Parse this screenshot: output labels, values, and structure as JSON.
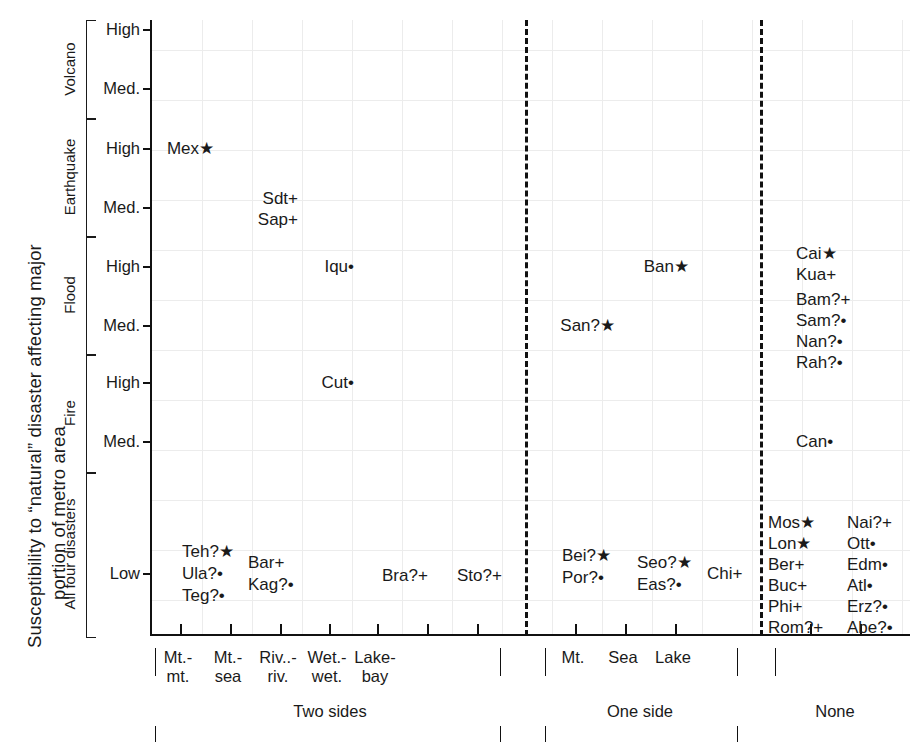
{
  "axis_title": {
    "line1": "Susceptibility to “natural” disaster affecting major",
    "line2": "portion of metro area"
  },
  "categories": [
    {
      "name": "Volcano",
      "label_top": 20,
      "label_bottom": 118,
      "levels": [
        "High",
        "Med."
      ]
    },
    {
      "name": "Earthquake",
      "label_top": 118,
      "label_bottom": 236,
      "levels": [
        "High",
        "Med."
      ]
    },
    {
      "name": "Flood",
      "label_top": 236,
      "label_bottom": 354,
      "levels": [
        "High",
        "Med."
      ]
    },
    {
      "name": "Fire",
      "label_top": 354,
      "label_bottom": 472,
      "levels": [
        "High",
        "Med."
      ]
    },
    {
      "name": "All four disasters",
      "label_top": 472,
      "label_bottom": 636,
      "levels": [
        "Low"
      ]
    }
  ],
  "y_ticks": [
    {
      "label": "High",
      "y": 29
    },
    {
      "label": "Med.",
      "y": 88
    },
    {
      "label": "High",
      "y": 148
    },
    {
      "label": "Med.",
      "y": 207
    },
    {
      "label": "High",
      "y": 266
    },
    {
      "label": "Med.",
      "y": 325
    },
    {
      "label": "High",
      "y": 382
    },
    {
      "label": "Med.",
      "y": 441
    },
    {
      "label": "Low",
      "y": 573
    }
  ],
  "x_ticks": [
    178,
    228,
    278,
    327,
    375,
    425,
    475,
    573,
    623,
    673,
    808,
    858
  ],
  "x_labels": [
    {
      "text": "Mt.-\nmt.",
      "x": 178
    },
    {
      "text": "Mt.-\nsea",
      "x": 228
    },
    {
      "text": "Riv..-\nriv.",
      "x": 278
    },
    {
      "text": "Wet.-\nwet.",
      "x": 327
    },
    {
      "text": "Lake-\nbay",
      "x": 375
    },
    {
      "text": "Mt.",
      "x": 573
    },
    {
      "text": "Sea",
      "x": 623
    },
    {
      "text": "Lake",
      "x": 673
    }
  ],
  "x_groups": [
    {
      "label": "Two sides",
      "x": 330
    },
    {
      "label": "One side",
      "x": 640
    },
    {
      "label": "None",
      "x": 835
    }
  ],
  "dividers": [
    523,
    758
  ],
  "chart_data": {
    "type": "scatter",
    "title": "Susceptibility to “natural” disaster affecting major portion of metro area",
    "xlabel": "",
    "ylabel": "Susceptibility to “natural” disaster affecting major portion of metro area",
    "grid": true,
    "legend": "none",
    "marker_meanings": {
      "star": "★-class",
      "plus": "+-class",
      "dot": "•-class"
    },
    "xlim": [
      "Mt.-mt.",
      "None"
    ],
    "ylim": [
      "Low",
      "Volcano High"
    ],
    "x_tick_labels": [
      "Mt.-mt.",
      "Mt.-sea",
      "Riv..-riv.",
      "Wet.-wet.",
      "Lake-bay",
      "Mt.",
      "Sea",
      "Lake"
    ],
    "y_tick_labels": [
      "High",
      "Med.",
      "High",
      "Med.",
      "High",
      "Med.",
      "High",
      "Med.",
      "Low"
    ],
    "y_category_labels": [
      "Volcano",
      "Earthquake",
      "Flood",
      "Fire",
      "All four disasters"
    ],
    "x_group_labels": [
      "Two sides",
      "One side",
      "None"
    ],
    "points": [
      {
        "name": "Mex",
        "marker": "★",
        "uncertain": false,
        "x_cat": "Mt.-mt.",
        "y_cat": "Earthquake High",
        "px": 212,
        "py": 148,
        "align": "right"
      },
      {
        "name": "Sdt",
        "marker": "+",
        "uncertain": false,
        "x_cat": "Mt.-sea",
        "y_cat": "Earthquake Med.",
        "px": 296,
        "py": 198,
        "align": "right"
      },
      {
        "name": "Sap",
        "marker": "+",
        "uncertain": false,
        "x_cat": "Mt.-sea",
        "y_cat": "Earthquake Med.",
        "px": 296,
        "py": 219,
        "align": "right"
      },
      {
        "name": "Iqu",
        "marker": "•",
        "uncertain": false,
        "x_cat": "Riv..-riv.",
        "y_cat": "Flood High",
        "px": 352,
        "py": 266,
        "align": "right"
      },
      {
        "name": "Cut",
        "marker": "•",
        "uncertain": false,
        "x_cat": "Riv..-riv.",
        "y_cat": "Fire High",
        "px": 352,
        "py": 382,
        "align": "right"
      },
      {
        "name": "Ban",
        "marker": "★",
        "uncertain": false,
        "x_cat": "Sea",
        "y_cat": "Flood High",
        "px": 687,
        "py": 266,
        "align": "right"
      },
      {
        "name": "San",
        "marker": "★",
        "uncertain": true,
        "x_cat": "Mt.",
        "y_cat": "Flood Med.",
        "px": 613,
        "py": 325,
        "align": "right"
      },
      {
        "name": "Cai",
        "marker": "★",
        "uncertain": false,
        "x_cat": "None",
        "y_cat": "Flood High",
        "px": 794,
        "py": 253,
        "align": "left"
      },
      {
        "name": "Kua",
        "marker": "+",
        "uncertain": false,
        "x_cat": "None",
        "y_cat": "Flood High",
        "px": 794,
        "py": 274,
        "align": "left"
      },
      {
        "name": "Bam",
        "marker": "+",
        "uncertain": true,
        "x_cat": "None",
        "y_cat": "Flood Med.",
        "px": 794,
        "py": 299,
        "align": "left"
      },
      {
        "name": "Sam",
        "marker": "•",
        "uncertain": true,
        "x_cat": "None",
        "y_cat": "Flood Med.",
        "px": 794,
        "py": 320,
        "align": "left"
      },
      {
        "name": "Nan",
        "marker": "•",
        "uncertain": true,
        "x_cat": "None",
        "y_cat": "Flood Med.",
        "px": 794,
        "py": 341,
        "align": "left"
      },
      {
        "name": "Rah",
        "marker": "•",
        "uncertain": true,
        "x_cat": "None",
        "y_cat": "Flood Med.",
        "px": 794,
        "py": 362,
        "align": "left"
      },
      {
        "name": "Can",
        "marker": "•",
        "uncertain": false,
        "x_cat": "None",
        "y_cat": "Fire Med.",
        "px": 794,
        "py": 441,
        "align": "left"
      },
      {
        "name": "Teh",
        "marker": "★",
        "uncertain": true,
        "x_cat": "Mt.-mt.",
        "y_cat": "Low",
        "px": 180,
        "py": 551,
        "align": "left"
      },
      {
        "name": "Ula",
        "marker": "•",
        "uncertain": true,
        "x_cat": "Mt.-mt.",
        "y_cat": "Low",
        "px": 180,
        "py": 573,
        "align": "left"
      },
      {
        "name": "Teg",
        "marker": "•",
        "uncertain": true,
        "x_cat": "Mt.-mt.",
        "y_cat": "Low",
        "px": 180,
        "py": 595,
        "align": "left"
      },
      {
        "name": "Bar",
        "marker": "+",
        "uncertain": false,
        "x_cat": "Mt.-sea",
        "y_cat": "Low",
        "px": 246,
        "py": 562,
        "align": "left"
      },
      {
        "name": "Kag",
        "marker": "•",
        "uncertain": true,
        "x_cat": "Mt.-sea",
        "y_cat": "Low",
        "px": 246,
        "py": 584,
        "align": "left"
      },
      {
        "name": "Bra",
        "marker": "+",
        "uncertain": true,
        "x_cat": "Wet.-wet.",
        "y_cat": "Low",
        "px": 380,
        "py": 575,
        "align": "left"
      },
      {
        "name": "Sto",
        "marker": "+",
        "uncertain": true,
        "x_cat": "Lake-bay",
        "y_cat": "Low",
        "px": 455,
        "py": 575,
        "align": "left"
      },
      {
        "name": "Bei",
        "marker": "★",
        "uncertain": true,
        "x_cat": "Mt.",
        "y_cat": "Low",
        "px": 560,
        "py": 555,
        "align": "left"
      },
      {
        "name": "Por",
        "marker": "•",
        "uncertain": true,
        "x_cat": "Mt.",
        "y_cat": "Low",
        "px": 560,
        "py": 577,
        "align": "left"
      },
      {
        "name": "Seo",
        "marker": "★",
        "uncertain": true,
        "x_cat": "Sea",
        "y_cat": "Low",
        "px": 635,
        "py": 562,
        "align": "left"
      },
      {
        "name": "Eas",
        "marker": "•",
        "uncertain": true,
        "x_cat": "Sea",
        "y_cat": "Low",
        "px": 635,
        "py": 584,
        "align": "left"
      },
      {
        "name": "Chi",
        "marker": "+",
        "uncertain": false,
        "x_cat": "Lake",
        "y_cat": "Low",
        "px": 705,
        "py": 573,
        "align": "left"
      },
      {
        "name": "Mos",
        "marker": "★",
        "uncertain": false,
        "x_cat": "None",
        "y_cat": "Low",
        "px": 766,
        "py": 522,
        "align": "left"
      },
      {
        "name": "Lon",
        "marker": "★",
        "uncertain": false,
        "x_cat": "None",
        "y_cat": "Low",
        "px": 766,
        "py": 543,
        "align": "left"
      },
      {
        "name": "Ber",
        "marker": "+",
        "uncertain": false,
        "x_cat": "None",
        "y_cat": "Low",
        "px": 766,
        "py": 564,
        "align": "left"
      },
      {
        "name": "Buc",
        "marker": "+",
        "uncertain": false,
        "x_cat": "None",
        "y_cat": "Low",
        "px": 766,
        "py": 585,
        "align": "left"
      },
      {
        "name": "Phi",
        "marker": "+",
        "uncertain": false,
        "x_cat": "None",
        "y_cat": "Low",
        "px": 766,
        "py": 606,
        "align": "left"
      },
      {
        "name": "Rom",
        "marker": "+",
        "uncertain": true,
        "x_cat": "None",
        "y_cat": "Low",
        "px": 766,
        "py": 627,
        "align": "left"
      },
      {
        "name": "Nai",
        "marker": "+",
        "uncertain": true,
        "x_cat": "None",
        "y_cat": "Low",
        "px": 845,
        "py": 522,
        "align": "left"
      },
      {
        "name": "Ott",
        "marker": "•",
        "uncertain": false,
        "x_cat": "None",
        "y_cat": "Low",
        "px": 845,
        "py": 543,
        "align": "left"
      },
      {
        "name": "Edm",
        "marker": "•",
        "uncertain": false,
        "x_cat": "None",
        "y_cat": "Low",
        "px": 845,
        "py": 564,
        "align": "left"
      },
      {
        "name": "Atl",
        "marker": "•",
        "uncertain": false,
        "x_cat": "None",
        "y_cat": "Low",
        "px": 845,
        "py": 585,
        "align": "left"
      },
      {
        "name": "Erz",
        "marker": "•",
        "uncertain": true,
        "x_cat": "None",
        "y_cat": "Low",
        "px": 845,
        "py": 606,
        "align": "left"
      },
      {
        "name": "Abe",
        "marker": "•",
        "uncertain": true,
        "x_cat": "None",
        "y_cat": "Low",
        "px": 845,
        "py": 627,
        "align": "left"
      }
    ]
  }
}
